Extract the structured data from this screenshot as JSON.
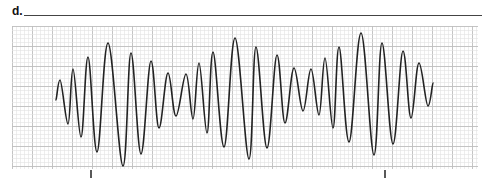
{
  "question": {
    "label": "d.",
    "answer_line": ""
  },
  "strip": {
    "grid": {
      "x": 12,
      "y": 26,
      "width": 466,
      "height": 143,
      "minor_step": 4,
      "major_step": 20,
      "minor_color": "#e2e2e2",
      "major_color": "#bdbdbd"
    },
    "trace_color": "#222222",
    "trace_points": [
      [
        56,
        100
      ],
      [
        60,
        80
      ],
      [
        68,
        124
      ],
      [
        73,
        69
      ],
      [
        81,
        137
      ],
      [
        88,
        57
      ],
      [
        97,
        152
      ],
      [
        108,
        43
      ],
      [
        123,
        166
      ],
      [
        131,
        53
      ],
      [
        141,
        154
      ],
      [
        151,
        61
      ],
      [
        159,
        128
      ],
      [
        168,
        73
      ],
      [
        176,
        116
      ],
      [
        186,
        74
      ],
      [
        193,
        119
      ],
      [
        199,
        63
      ],
      [
        207,
        133
      ],
      [
        213,
        52
      ],
      [
        224,
        147
      ],
      [
        235,
        38
      ],
      [
        249,
        159
      ],
      [
        256,
        47
      ],
      [
        267,
        148
      ],
      [
        277,
        55
      ],
      [
        285,
        123
      ],
      [
        294,
        68
      ],
      [
        303,
        111
      ],
      [
        311,
        69
      ],
      [
        319,
        115
      ],
      [
        325,
        58
      ],
      [
        333,
        128
      ],
      [
        339,
        47
      ],
      [
        349,
        142
      ],
      [
        361,
        33
      ],
      [
        374,
        155
      ],
      [
        382,
        43
      ],
      [
        393,
        144
      ],
      [
        403,
        51
      ],
      [
        411,
        118
      ],
      [
        419,
        63
      ],
      [
        428,
        106
      ],
      [
        433,
        83
      ]
    ],
    "tick_marks": [
      {
        "x": 91
      },
      {
        "x": 385
      }
    ]
  }
}
